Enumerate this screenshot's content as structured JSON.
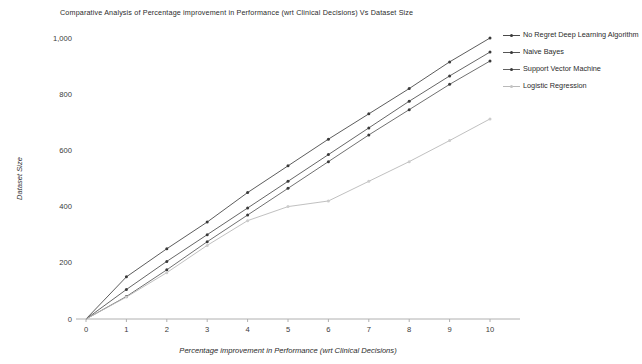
{
  "chart_data": {
    "type": "line",
    "title": "Comparative Analysis of Percentage improvement in Performance (wrt Clinical Decisions) Vs Dataset Size",
    "xlabel": "Percentage improvement in Performance (wrt Clinical Decisions)",
    "ylabel": "Dataset Size",
    "x": [
      0,
      1,
      2,
      3,
      4,
      5,
      6,
      7,
      8,
      9,
      10
    ],
    "xlim": [
      0,
      10
    ],
    "ylim": [
      0,
      1000
    ],
    "xticks": [
      "0",
      "1",
      "2",
      "3",
      "4",
      "5",
      "6",
      "7",
      "8",
      "9",
      "10"
    ],
    "yticks": [
      "0",
      "200",
      "400",
      "600",
      "800",
      "1,000"
    ],
    "ytick_values": [
      0,
      200,
      400,
      600,
      800,
      1000
    ],
    "grid": false,
    "legend_position": "right",
    "series": [
      {
        "name": "No Regret Deep Learning Algorithm",
        "color": "#4a4a4a",
        "values": [
          0,
          150,
          250,
          345,
          450,
          545,
          640,
          730,
          820,
          915,
          1000
        ]
      },
      {
        "name": "Naive Bayes",
        "color": "#555555",
        "values": [
          0,
          105,
          205,
          300,
          395,
          490,
          585,
          680,
          775,
          865,
          950
        ]
      },
      {
        "name": "Support Vector Machine",
        "color": "#606060",
        "values": [
          0,
          80,
          175,
          275,
          370,
          465,
          560,
          655,
          745,
          835,
          918
        ]
      },
      {
        "name": "Logistic Regression",
        "color": "#b9b9b9",
        "values": [
          0,
          78,
          165,
          262,
          350,
          400,
          420,
          490,
          560,
          635,
          712
        ]
      }
    ]
  }
}
